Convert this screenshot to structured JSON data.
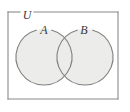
{
  "figure": {
    "kind": "venn-diagram",
    "universe": {
      "label": "U",
      "border_color": "#8a8a8a",
      "fill_color": "#ffffff",
      "rect": {
        "x": 8,
        "y": 12,
        "width": 110,
        "height": 87
      },
      "label_gap": {
        "x": 20,
        "width": 14
      },
      "label_position": {
        "x": 27,
        "y": 16
      }
    },
    "sets": [
      {
        "label": "A",
        "cx": 44,
        "cy": 57,
        "r": 28,
        "fill_color": "#ececeb",
        "stroke_color": "#7f7f7f",
        "label_position": {
          "x": 44,
          "y": 31
        },
        "label_gap_start_deg": -105,
        "label_gap_end_deg": -75
      },
      {
        "label": "B",
        "cx": 85,
        "cy": 57,
        "r": 28,
        "fill_color": "#ececeb",
        "stroke_color": "#7f7f7f",
        "label_position": {
          "x": 84,
          "y": 31
        },
        "label_gap_start_deg": -105,
        "label_gap_end_deg": -75
      }
    ],
    "intersection": {
      "shaded": true,
      "fill_color": "#ececeb"
    }
  }
}
